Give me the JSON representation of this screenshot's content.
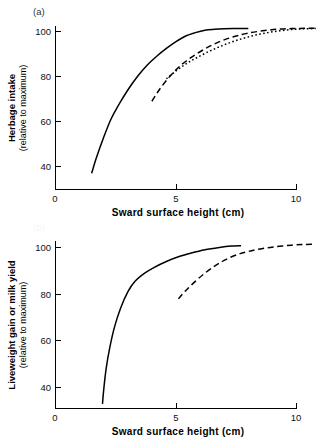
{
  "figure": {
    "background": "#ffffff",
    "ink_color": "#000000"
  },
  "panels": [
    {
      "id": "a",
      "label": "(a)",
      "label_visible": true,
      "ylabel_main": "Herbage intake",
      "ylabel_sub": "(relative to maximum)",
      "xlabel": "Sward surface height (cm)",
      "xticks": [
        "0",
        "5",
        "10"
      ],
      "yticks": [
        "40",
        "60",
        "80",
        "100"
      ]
    },
    {
      "id": "b",
      "label": "(b)",
      "label_visible": false,
      "ylabel_main": "Liveweight gain or milk yield",
      "ylabel_sub": "(relative to maximum)",
      "xlabel": "Sward surface height (cm)",
      "xticks": [
        "0",
        "5",
        "10"
      ],
      "yticks": [
        "40",
        "60",
        "80",
        "100"
      ]
    }
  ],
  "chart_data": [
    {
      "type": "line",
      "panel": "a",
      "title": "(a)",
      "xlabel": "Sward surface height (cm)",
      "ylabel": "Herbage intake (relative to maximum)",
      "xlim": [
        0,
        11.2
      ],
      "ylim": [
        30,
        104
      ],
      "xticks": [
        0,
        5,
        10
      ],
      "yticks": [
        40,
        60,
        80,
        100
      ],
      "grid": false,
      "legend": "none",
      "series": [
        {
          "name": "solid-curve",
          "style": "solid",
          "x": [
            1.5,
            1.7,
            2.0,
            2.3,
            2.6,
            3.0,
            3.4,
            3.8,
            4.2,
            4.6,
            5.0,
            5.4,
            5.8,
            6.2,
            6.6,
            7.0,
            7.4,
            7.8,
            8.0
          ],
          "y": [
            37,
            44,
            53,
            61,
            67,
            74,
            80,
            85,
            89,
            92.5,
            95.5,
            98,
            99.5,
            100.6,
            101,
            101.2,
            101.3,
            101.3,
            101.3
          ]
        },
        {
          "name": "dashed-curve",
          "style": "dashed",
          "x": [
            4.0,
            4.3,
            4.7,
            5.1,
            5.5,
            6.0,
            6.5,
            7.0,
            7.5,
            8.0,
            8.6,
            9.2,
            9.8,
            10.4,
            10.9
          ],
          "y": [
            69,
            74,
            79.5,
            84,
            87.5,
            91,
            94,
            96.3,
            98,
            99.3,
            100.3,
            101,
            101.3,
            101.4,
            101.4
          ]
        },
        {
          "name": "dotted-curve",
          "style": "dotted",
          "x": [
            4.6,
            5.0,
            5.4,
            5.8,
            6.3,
            6.8,
            7.3,
            7.8,
            8.3,
            8.8,
            9.3,
            9.8,
            10.3,
            10.8
          ],
          "y": [
            79,
            82.5,
            85.5,
            88,
            90.8,
            93.2,
            95.3,
            97,
            98.4,
            99.5,
            100.3,
            100.9,
            101.2,
            101.3
          ]
        }
      ]
    },
    {
      "type": "line",
      "panel": "b",
      "title": "(b)",
      "xlabel": "Sward surface height (cm)",
      "ylabel": "Liveweight gain or milk yield (relative to maximum)",
      "xlim": [
        0,
        11.2
      ],
      "ylim": [
        30,
        104
      ],
      "xticks": [
        0,
        5,
        10
      ],
      "yticks": [
        40,
        60,
        80,
        100
      ],
      "grid": false,
      "legend": "none",
      "series": [
        {
          "name": "solid-curve",
          "style": "solid",
          "x": [
            1.95,
            2.0,
            2.1,
            2.25,
            2.45,
            2.7,
            3.0,
            3.3,
            3.7,
            4.1,
            4.6,
            5.1,
            5.6,
            6.2,
            6.8,
            7.3,
            7.7
          ],
          "y": [
            33,
            39,
            48,
            57,
            66,
            74,
            81,
            85.5,
            89,
            91.5,
            94,
            96,
            97.5,
            99,
            100,
            100.6,
            100.8
          ]
        },
        {
          "name": "dashed-curve",
          "style": "dashed",
          "x": [
            5.1,
            5.4,
            5.8,
            6.2,
            6.6,
            7.0,
            7.5,
            8.0,
            8.6,
            9.2,
            9.8,
            10.3,
            10.7
          ],
          "y": [
            78,
            81.5,
            85.5,
            89,
            92,
            94.5,
            96.8,
            98.3,
            99.6,
            100.4,
            101,
            101.3,
            101.4
          ]
        }
      ]
    }
  ]
}
